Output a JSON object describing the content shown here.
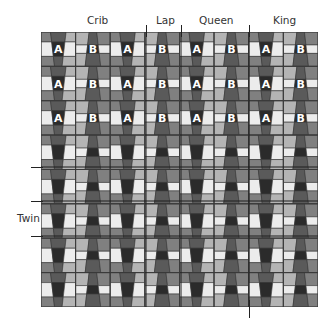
{
  "diagram": {
    "type": "quilt-layout",
    "labels": {
      "crib": "Crib",
      "lap": "Lap",
      "queen": "Queen",
      "king": "King",
      "twin": "Twin"
    },
    "grid": {
      "columns": 8,
      "rows": 8,
      "block_letters_rows": 3,
      "block_letter_pattern": [
        "A",
        "B"
      ]
    },
    "colors": {
      "black": "#2b2b2b",
      "dark": "#5a5a5a",
      "mid": "#808080",
      "light": "#b4b4b4",
      "white": "#ececec",
      "border": "#3a3a3a",
      "letter": "#ffffff"
    }
  }
}
